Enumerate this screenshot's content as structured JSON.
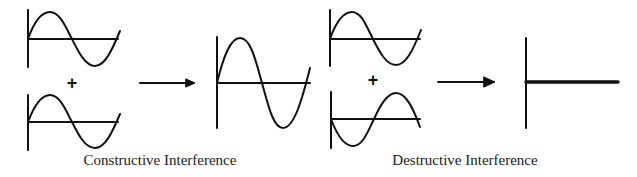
{
  "diagram": {
    "colors": {
      "stroke": "#111111",
      "background": "#ffffff"
    },
    "panels": [
      {
        "id": "constructive",
        "caption": "Constructive Interference",
        "operator": "+",
        "inputs": [
          {
            "name": "wave-1",
            "phase": "in-phase",
            "amplitude": 1
          },
          {
            "name": "wave-2",
            "phase": "in-phase",
            "amplitude": 1
          }
        ],
        "result": {
          "name": "sum-wave",
          "amplitude": 2,
          "description": "larger amplitude sine wave"
        }
      },
      {
        "id": "destructive",
        "caption": "Destructive Interference",
        "operator": "+",
        "inputs": [
          {
            "name": "wave-1",
            "phase": "0",
            "amplitude": 1
          },
          {
            "name": "wave-2",
            "phase": "180 degrees (inverted)",
            "amplitude": 1
          }
        ],
        "result": {
          "name": "flat-line",
          "amplitude": 0,
          "description": "waves cancel to a flat line"
        }
      }
    ]
  }
}
